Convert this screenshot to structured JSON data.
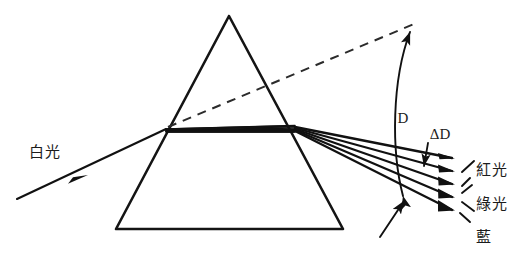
{
  "figure": {
    "background_color": "#ffffff",
    "ink_color": "#141414",
    "width": 512,
    "height": 255
  },
  "labels": {
    "incident_beam": "白光",
    "deviation_angle": "D",
    "angular_dispersion": "ΔD",
    "ray_red": "紅光",
    "ray_green": "綠光",
    "ray_blue": "藍"
  },
  "prism": {
    "name": "triangular-prism",
    "apex": {
      "x": 229,
      "y": 16
    },
    "base_left": {
      "x": 116,
      "y": 229
    },
    "base_right": {
      "x": 343,
      "y": 229
    }
  },
  "optics": {
    "entry_point": {
      "x": 166,
      "y": 129
    },
    "exit_point": {
      "x": 295,
      "y": 128
    },
    "incident_start": {
      "x": 17,
      "y": 199
    },
    "incident_arrow_at": {
      "x": 82,
      "y": 177
    },
    "undeviated_dashed_end": {
      "x": 414,
      "y": 24
    },
    "dispersed_rays": [
      {
        "name": "red",
        "label": "紅光",
        "end_x": 452,
        "end_y": 158
      },
      {
        "name": "orange",
        "label": "",
        "end_x": 452,
        "end_y": 171
      },
      {
        "name": "green",
        "label": "綠光",
        "end_x": 452,
        "end_y": 184
      },
      {
        "name": "blue",
        "label": "",
        "end_x": 452,
        "end_y": 197
      },
      {
        "name": "violet",
        "label": "藍",
        "end_x": 452,
        "end_y": 210
      }
    ]
  },
  "annotations": {
    "angle_D": {
      "from": "undeviated dashed extension",
      "to": "red dispersed ray",
      "label": "D",
      "label_x": 409,
      "label_y": 118
    },
    "angle_delta_D": {
      "from": "red dispersed ray",
      "to": "violet dispersed ray",
      "label": "ΔD",
      "label_x": 432,
      "label_y": 135
    }
  }
}
